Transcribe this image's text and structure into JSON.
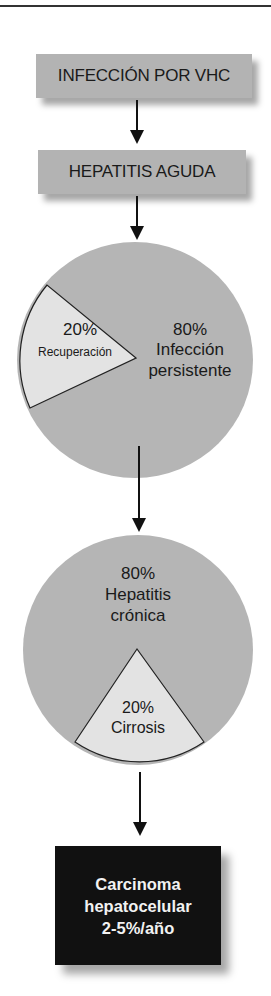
{
  "diagram": {
    "box1": "INFECCIÓN POR VHC",
    "box2": "HEPATITIS AGUDA",
    "pie1": {
      "small_pct": "20%",
      "small_label": "Recuperación",
      "large_pct": "80%",
      "large_label_line1": "Infección",
      "large_label_line2": "persistente"
    },
    "pie2": {
      "large_pct": "80%",
      "large_label_line1": "Hepatitis",
      "large_label_line2": "crónica",
      "small_pct": "20%",
      "small_label": "Cirrosis"
    },
    "final": {
      "line1": "Carcinoma",
      "line2": "hepatocelular",
      "line3": "2-5%/año"
    }
  },
  "colors": {
    "box_fill": "#b3b3b3",
    "pie_large": "#b5b5b5",
    "pie_small": "#e3e3e3",
    "final_fill": "#111111",
    "final_text": "#f2f2f2"
  }
}
